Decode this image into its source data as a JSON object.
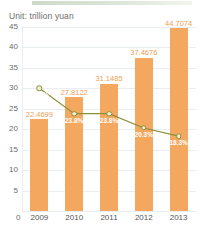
{
  "header": {
    "unit_label": "Unit: trillion yuan",
    "accent_bar_color": "#cfd9c9"
  },
  "axis": {
    "zero_label": "0"
  },
  "colors": {
    "bar": "#f4a85f",
    "value_label": "#f0a055",
    "line": "#8a8f3a",
    "marker_fill": "#f2f0d8",
    "pct_label": "#ffffff",
    "grid": "#e9eef3",
    "axis_text": "#6d6d6d"
  },
  "chart_data": {
    "type": "bar",
    "title": "Unit: trillion yuan",
    "xlabel": "",
    "ylabel": "",
    "ylim": [
      0,
      45
    ],
    "grid": true,
    "legend": "none",
    "categories": [
      "2009",
      "2010",
      "2011",
      "2012",
      "2013"
    ],
    "yticks": [
      "0",
      "5",
      "10",
      "15",
      "20",
      "25",
      "30",
      "35",
      "40",
      "45"
    ],
    "series": [
      {
        "name": "Total (trillion yuan)",
        "type": "bar",
        "values": [
          22.4699,
          27.8122,
          31.1485,
          37.4676,
          44.7074
        ],
        "labels": [
          "22.4699",
          "27.8122",
          "31.1485",
          "37.4676",
          "44.7074"
        ]
      },
      {
        "name": "Growth rate",
        "type": "line",
        "values": [
          30.0,
          23.8,
          23.8,
          20.3,
          18.3
        ],
        "labels": [
          "30.0%",
          "23.8%",
          "23.8%",
          "20.3%",
          "18.3%"
        ]
      }
    ]
  }
}
